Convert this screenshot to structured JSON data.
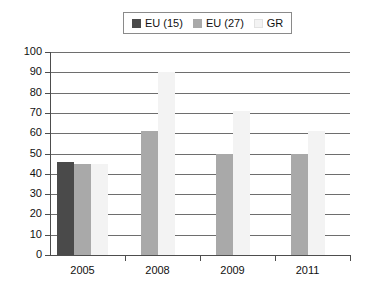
{
  "legend": {
    "position": "top-center",
    "entries": [
      {
        "label": "EU (15)",
        "color": "#4a4a4a",
        "icon": "legend-swatch-icon"
      },
      {
        "label": "EU (27)",
        "color": "#a9a9a9",
        "icon": "legend-swatch-icon"
      },
      {
        "label": "GR",
        "color": "#f3f3f3",
        "icon": "legend-swatch-icon"
      }
    ]
  },
  "chart_data": {
    "type": "bar",
    "title": "",
    "subtitle": "",
    "xlabel": "",
    "ylabel": "",
    "categories": [
      "2005",
      "2008",
      "2009",
      "2011"
    ],
    "series": [
      {
        "name": "EU (15)",
        "color": "#4a4a4a",
        "values": [
          46,
          null,
          null,
          null
        ]
      },
      {
        "name": "EU (27)",
        "color": "#a9a9a9",
        "values": [
          45,
          61,
          50,
          50
        ]
      },
      {
        "name": "GR",
        "color": "#f3f3f3",
        "values": [
          45,
          90,
          71,
          61
        ]
      }
    ],
    "ylim": [
      0,
      100
    ],
    "ytick_step": 10,
    "yticks": [
      0,
      10,
      20,
      30,
      40,
      50,
      60,
      70,
      80,
      90,
      100
    ],
    "ytick_labels": [
      "0",
      "10",
      "20",
      "30",
      "40",
      "50",
      "60",
      "70",
      "80",
      "90",
      "100"
    ],
    "grid": "horizontal",
    "legend_position": "top-center",
    "grid_color": "#6e6e6e",
    "axis_color": "#4d4d4d",
    "background": "#ffffff"
  }
}
